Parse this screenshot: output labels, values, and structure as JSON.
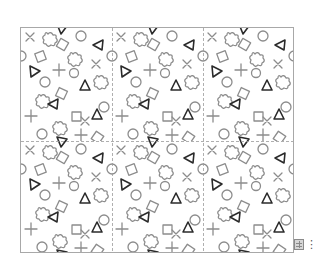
{
  "image": {
    "description": "Repeating pattern of outlined geometric shapes (crosses, plus signs, quatrefoils, squares, circles, triangles) divided into tiles by dashed guide lines",
    "tile_size_px": [
      91,
      113
    ],
    "tile_columns": 3,
    "tile_rows": 2,
    "colors": {
      "frame_border": "#a8a8a8",
      "light_shape": "#8c8c8c",
      "dark_shape": "#2a2a2a",
      "dashed_guide": "#9a9a9a",
      "background": "#ffffff"
    }
  },
  "controls": {
    "table_icon": "grid-icon",
    "more_icon": "⋮"
  }
}
